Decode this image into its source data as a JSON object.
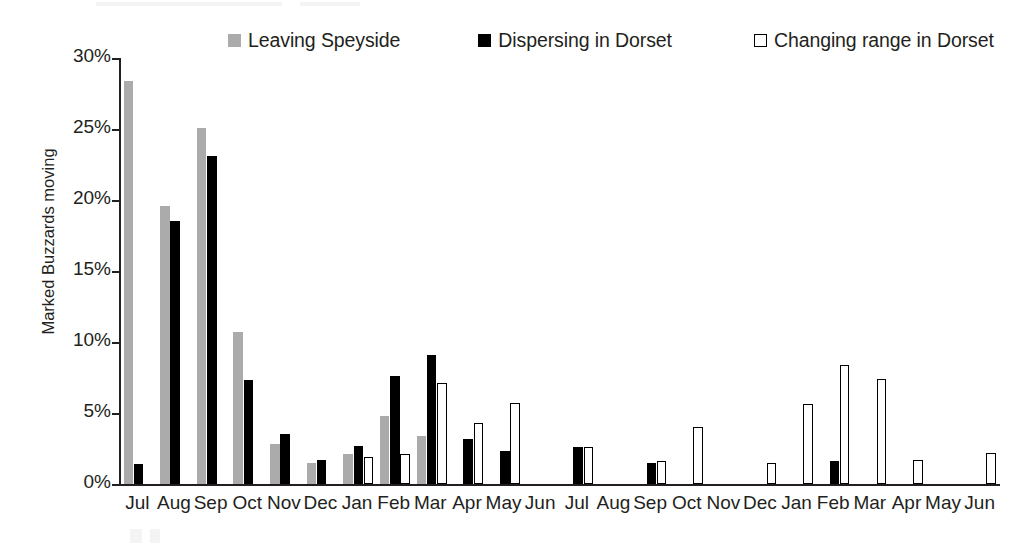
{
  "chart_data": {
    "type": "bar",
    "title": "",
    "xlabel": "",
    "ylabel": "Marked Buzzards moving",
    "ylim": [
      0,
      30
    ],
    "ytick_labels": [
      "0%",
      "5%",
      "10%",
      "15%",
      "20%",
      "25%",
      "30%"
    ],
    "ytick_values": [
      0,
      5,
      10,
      15,
      20,
      25,
      30
    ],
    "grid": false,
    "legend_position": "top",
    "categories": [
      "Jul",
      "Aug",
      "Sep",
      "Oct",
      "Nov",
      "Dec",
      "Jan",
      "Feb",
      "Mar",
      "Apr",
      "May",
      "Jun",
      "Jul",
      "Aug",
      "Sep",
      "Oct",
      "Nov",
      "Dec",
      "Jan",
      "Feb",
      "Mar",
      "Apr",
      "May",
      "Jun"
    ],
    "series": [
      {
        "name": "Leaving Speyside",
        "color": "#ababab",
        "style": "filled-gray",
        "values": [
          28.4,
          19.6,
          25.1,
          10.7,
          2.8,
          1.5,
          2.1,
          4.8,
          3.4,
          0,
          0,
          0,
          0,
          0,
          0,
          0,
          0,
          0,
          0,
          0,
          0,
          0,
          0,
          0
        ]
      },
      {
        "name": "Dispersing in Dorset",
        "color": "#000000",
        "style": "filled-black",
        "values": [
          1.4,
          18.5,
          23.1,
          7.3,
          3.5,
          1.7,
          2.7,
          7.6,
          9.1,
          3.2,
          2.3,
          0,
          2.6,
          0,
          1.5,
          0,
          0,
          0,
          0,
          1.6,
          0,
          0,
          0,
          0
        ]
      },
      {
        "name": "Changing range in Dorset",
        "color": "#ffffff",
        "style": "outlined-white",
        "values": [
          0,
          0,
          0,
          0,
          0,
          0,
          1.9,
          2.1,
          7.1,
          4.3,
          5.7,
          0,
          2.6,
          0,
          1.6,
          4.0,
          0,
          1.5,
          5.6,
          8.4,
          7.4,
          1.7,
          0,
          2.2
        ]
      }
    ]
  },
  "legend": {
    "items": [
      {
        "label": "Leaving Speyside",
        "swatch": "gray"
      },
      {
        "label": "Dispersing in Dorset",
        "swatch": "black"
      },
      {
        "label": "Changing range in Dorset",
        "swatch": "white"
      }
    ]
  },
  "axes": {
    "y_title": "Marked Buzzards moving"
  },
  "colors": {
    "series_gray": "#ababab",
    "series_black": "#000000",
    "series_white": "#ffffff",
    "axis": "#231f20",
    "background": "#ffffff"
  }
}
